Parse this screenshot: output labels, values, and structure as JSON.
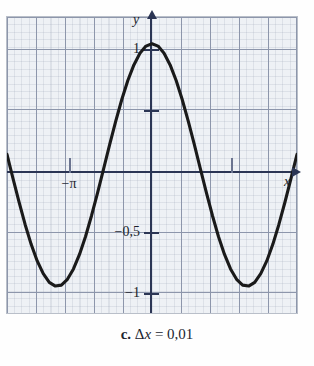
{
  "caption": {
    "index": "c.",
    "expr_delta": "Δ",
    "expr_var": "x",
    "expr_eq": "=",
    "expr_value": "0,01",
    "full": "c. Δx = 0,01"
  },
  "axes": {
    "x_label": "x",
    "y_label": "y",
    "x_tick_labels": [
      "−π",
      ""
    ],
    "y_tick_labels": [
      "1",
      "−0,5",
      "−1"
    ]
  },
  "colors": {
    "plot_background": "#eef1f5",
    "major_grid": "#8d96ab",
    "minor_grid": "#8c96aa",
    "axis": "#2b3554",
    "curve": "#1a1a1a",
    "frame": "#b9bfc9",
    "page": "#fefefe"
  },
  "chart_data": {
    "type": "line",
    "title": "",
    "subtitle": "",
    "xlabel": "x",
    "ylabel": "y",
    "function": "y = cos(x)",
    "xlim": [
      -4.8,
      4.8
    ],
    "ylim": [
      -1.22,
      1.22
    ],
    "grid": true,
    "legend_position": "none",
    "xticks": [
      -3.1416,
      3.1416
    ],
    "xtick_labels": [
      "−π",
      ""
    ],
    "yticks": [
      1,
      0.5,
      -0.5,
      -1
    ],
    "ytick_labels": [
      "1",
      "",
      "−0,5",
      "−1"
    ],
    "annotations": [
      "c. Δx = 0,01"
    ],
    "series": [
      {
        "name": "cos(x)",
        "x": [
          -4.8,
          -4.6,
          -4.4,
          -4.2,
          -4.0,
          -3.8,
          -3.6,
          -3.4,
          -3.2,
          -3.0,
          -2.8,
          -2.6,
          -2.4,
          -2.2,
          -2.0,
          -1.8,
          -1.6,
          -1.4,
          -1.2,
          -1.0,
          -0.8,
          -0.6,
          -0.4,
          -0.2,
          0.0,
          0.2,
          0.4,
          0.6,
          0.8,
          1.0,
          1.2,
          1.4,
          1.6,
          1.8,
          2.0,
          2.2,
          2.4,
          2.6,
          2.8,
          3.0,
          3.2,
          3.4,
          3.6,
          3.8,
          4.0,
          4.2,
          4.4,
          4.6,
          4.8
        ],
        "y": [
          0.087,
          -0.112,
          -0.307,
          -0.49,
          -0.654,
          -0.791,
          -0.896,
          -0.967,
          -0.998,
          -0.99,
          -0.942,
          -0.857,
          -0.737,
          -0.589,
          -0.416,
          -0.227,
          -0.029,
          0.17,
          0.362,
          0.54,
          0.697,
          0.825,
          0.921,
          0.98,
          1.0,
          0.98,
          0.921,
          0.825,
          0.697,
          0.54,
          0.362,
          0.17,
          -0.029,
          -0.227,
          -0.416,
          -0.589,
          -0.737,
          -0.857,
          -0.942,
          -0.99,
          -0.998,
          -0.967,
          -0.896,
          -0.791,
          -0.654,
          -0.49,
          -0.307,
          -0.112,
          0.087
        ]
      }
    ]
  }
}
